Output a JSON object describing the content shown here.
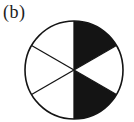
{
  "figure": {
    "label": "(b)",
    "total_sectors": 6,
    "shaded_count": 2,
    "colors": {
      "shaded": "#141414",
      "unshaded": "#ffffff",
      "outline": "#141414",
      "label": "#1c1c1c",
      "background": "#ffffff"
    },
    "sectors": [
      {
        "name": "upper-right",
        "span_deg": "30-90",
        "shaded": true,
        "fill": "#141414"
      },
      {
        "name": "upper-left",
        "span_deg": "90-150",
        "shaded": false,
        "fill": "#ffffff"
      },
      {
        "name": "left",
        "span_deg": "150-210",
        "shaded": false,
        "fill": "#ffffff"
      },
      {
        "name": "lower-left",
        "span_deg": "210-270",
        "shaded": false,
        "fill": "#ffffff"
      },
      {
        "name": "lower-right",
        "span_deg": "270-330",
        "shaded": true,
        "fill": "#141414"
      },
      {
        "name": "right",
        "span_deg": "330-30",
        "shaded": false,
        "fill": "#ffffff"
      }
    ]
  }
}
